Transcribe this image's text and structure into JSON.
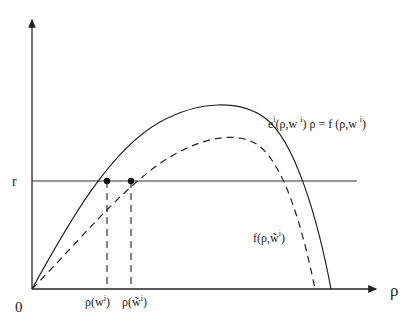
{
  "diagram": {
    "axes": {
      "origin_label": "0",
      "x_label": "ρ",
      "y_tick_label": "r"
    },
    "curves": {
      "solid_label_html": "eⁱ(ρ,w ⁱ) ρ = f (ρ,w ⁱ)",
      "solid_label": "ei(ρ,w i) ρ = f (ρ,w i)",
      "dashed_label": "f(ρ,w̃ⁱ)"
    },
    "x_ticks": {
      "rho_w": "ρ(wⁱ)",
      "rho_w_tilde": "ρ(w̃ⁱ)"
    },
    "colors": {
      "line": "#222222",
      "background": "#ffffff"
    }
  }
}
